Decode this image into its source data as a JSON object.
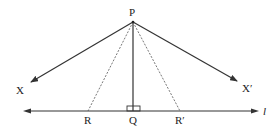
{
  "diagram": {
    "type": "geometry",
    "points": {
      "P": {
        "label": "P",
        "x": 133,
        "y": 22
      },
      "Q": {
        "label": "Q",
        "x": 133,
        "y": 111
      },
      "R": {
        "label": "R",
        "x": 88,
        "y": 111
      },
      "R_prime": {
        "label": "R′",
        "x": 180,
        "y": 111
      }
    },
    "rays": {
      "X": {
        "label": "X",
        "from": [
          133,
          22
        ],
        "to": [
          29,
          83
        ]
      },
      "X_prime": {
        "label": "X′",
        "from": [
          133,
          22
        ],
        "to": [
          239,
          82
        ]
      }
    },
    "line_l": {
      "label": "l",
      "from": [
        23,
        111
      ],
      "to": [
        259,
        111
      ]
    },
    "segments": [
      {
        "name": "PQ",
        "style": "solid",
        "note": "perpendicular to l"
      },
      {
        "name": "PR",
        "style": "dashed"
      },
      {
        "name": "PR′",
        "style": "dashed"
      }
    ],
    "right_angle_marker_at": "Q",
    "colors": {
      "stroke": "#333333",
      "dashed": "#555555",
      "background": "#ffffff"
    }
  }
}
